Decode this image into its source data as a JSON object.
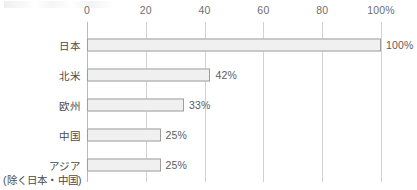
{
  "chart_data": {
    "type": "bar",
    "orientation": "horizontal",
    "title": "",
    "subtitle": "",
    "xlabel": "",
    "ylabel": "",
    "xlim": [
      0,
      100
    ],
    "grid": true,
    "legend": false,
    "categories": [
      "日本",
      "北米",
      "欧州",
      "中国",
      "アジア"
    ],
    "category_sublabels": [
      "",
      "",
      "",
      "",
      "(除く日本・中国)"
    ],
    "values": [
      100,
      42,
      33,
      25,
      25
    ],
    "value_labels": [
      "100%",
      "42%",
      "33%",
      "25%",
      "25%"
    ],
    "tick_values": [
      0,
      20,
      40,
      60,
      80,
      100
    ],
    "tick_labels": [
      "0",
      "20",
      "40",
      "60",
      "80",
      "100%"
    ],
    "colors": {
      "bar_fill": "#f0f0f0",
      "bar_border": "#9d9d9d",
      "gridline": "#d2d2d2",
      "axis_zero": "#b9b9b9",
      "tick_text": "#6e6e6e",
      "category_text": "#4a4a4a",
      "value_text": "#5c5c5c",
      "background": "#ffffff"
    }
  }
}
